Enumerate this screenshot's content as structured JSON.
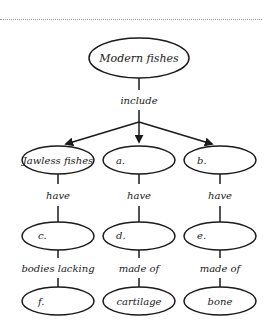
{
  "diagram": {
    "type": "concept-map",
    "root": {
      "id": "root",
      "label": "Modern fishes",
      "cx": 139,
      "cy": 58,
      "rx": 50,
      "ry": 20
    },
    "root_link_label": "include",
    "columns": [
      {
        "name": "jawless",
        "nodes": [
          {
            "id": "jawless",
            "label": "Jawless fishes",
            "cx": 58,
            "cy": 160
          },
          {
            "id": "c",
            "label": "c.",
            "cx": 58,
            "cy": 236
          },
          {
            "id": "f",
            "label": "f.",
            "cx": 58,
            "cy": 301
          }
        ],
        "links": [
          "have",
          "bodies lacking"
        ]
      },
      {
        "name": "a",
        "nodes": [
          {
            "id": "a",
            "label": "a.",
            "cx": 139,
            "cy": 160
          },
          {
            "id": "d",
            "label": "d.",
            "cx": 139,
            "cy": 236
          },
          {
            "id": "cartilage",
            "label": "cartilage",
            "cx": 139,
            "cy": 301
          }
        ],
        "links": [
          "have",
          "made of"
        ]
      },
      {
        "name": "b",
        "nodes": [
          {
            "id": "b",
            "label": "b.",
            "cx": 220,
            "cy": 160
          },
          {
            "id": "e",
            "label": "e.",
            "cx": 220,
            "cy": 236
          },
          {
            "id": "bone",
            "label": "bone",
            "cx": 220,
            "cy": 301
          }
        ],
        "links": [
          "have",
          "made of"
        ]
      }
    ],
    "colors": {
      "stroke": "#1a1a1a",
      "text": "#1a1a1a",
      "background": "#ffffff",
      "dots": "#9a9a9a"
    }
  }
}
